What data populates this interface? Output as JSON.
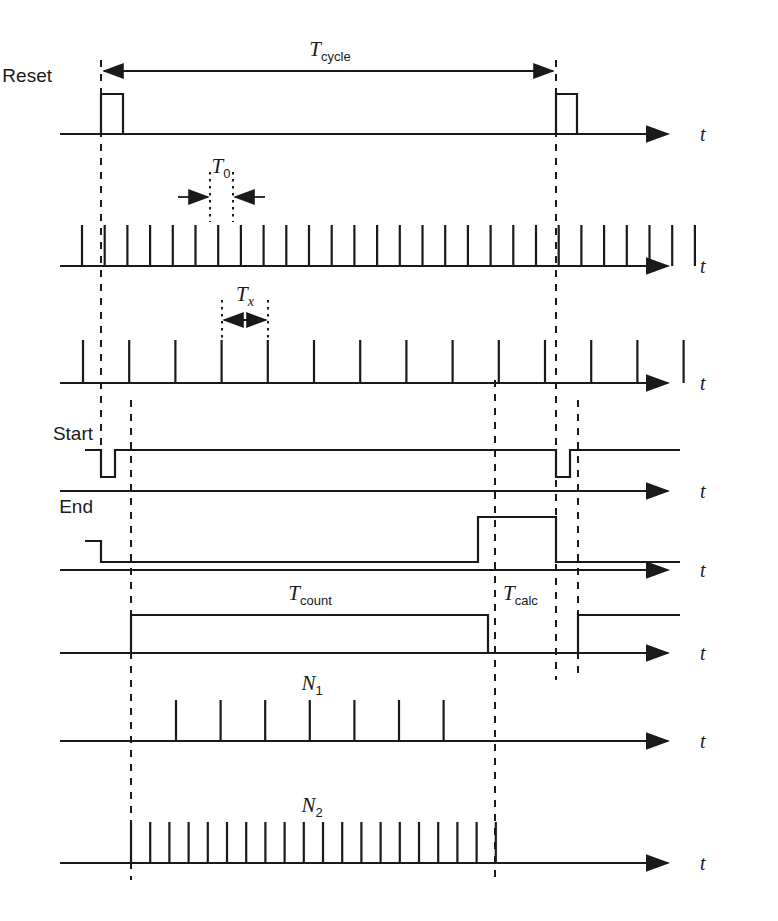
{
  "figure": {
    "type": "timing-diagram",
    "title": "",
    "background": "#ffffff",
    "ink": "#1a1a1a",
    "axis_symbol": "t"
  },
  "labels": {
    "reset": "Reset",
    "start": "Start",
    "end": "End",
    "t_axis": "t"
  },
  "annotations": {
    "t_cycle": {
      "base": "T",
      "sub": "cycle"
    },
    "t_zero": {
      "base": "T",
      "sub": "0"
    },
    "t_x": {
      "base": "T",
      "sub": "x"
    },
    "t_count": {
      "base": "T",
      "sub": "count"
    },
    "t_calc": {
      "base": "T",
      "sub": "calc"
    },
    "n_one": {
      "base": "N",
      "sub": "1"
    },
    "n_two": {
      "base": "N",
      "sub": "2"
    }
  },
  "chart_data": {
    "type": "timing-waveform",
    "xlabel": "t",
    "ylabel": "",
    "time_markers": {
      "cycle_start": 101,
      "count_start": 131,
      "count_end": 488,
      "calc_mark": 495,
      "cycle_end": 556,
      "calc_end": 578
    },
    "traces": [
      {
        "name": "Reset",
        "kind": "pulse-high",
        "label": "Reset",
        "baseline_y": 134,
        "high_y": 94,
        "pulses": [
          {
            "start": 101,
            "end": 123
          },
          {
            "start": 556,
            "end": 577
          }
        ],
        "axis_x0": 60,
        "axis_x1": 680,
        "annotation": "T_cycle spanning 101 to 556"
      },
      {
        "name": "T0 clock",
        "kind": "impulse-train",
        "label": "",
        "baseline_y": 266,
        "pulse_top_y": 225,
        "count": 28,
        "first_x": 82,
        "spacing": 22.7,
        "axis_x0": 60,
        "axis_x1": 680,
        "period_marker": {
          "symbol": "T0",
          "from": 210,
          "to": 233
        }
      },
      {
        "name": "Tx clock",
        "kind": "impulse-train",
        "label": "",
        "baseline_y": 383,
        "pulse_top_y": 340,
        "count": 14,
        "first_x": 83,
        "spacing": 46.2,
        "axis_x0": 60,
        "axis_x1": 680,
        "period_marker": {
          "symbol": "Tx",
          "from": 222,
          "to": 268
        }
      },
      {
        "name": "Start",
        "kind": "level-low-notch",
        "label": "Start",
        "baseline_y": 491,
        "high_y": 450,
        "low_y": 477,
        "line_x0": 85,
        "line_x1": 680,
        "notches": [
          {
            "start": 101,
            "end": 115
          },
          {
            "start": 556,
            "end": 570
          }
        ],
        "axis_x0": 60,
        "axis_x1": 680
      },
      {
        "name": "End",
        "kind": "level-high-pulse",
        "label": "End",
        "baseline_y": 570,
        "idle_y": 541,
        "high_y": 517,
        "line_x0": 85,
        "line_x1": 680,
        "low_from": 101,
        "pulses": [
          {
            "start": 478,
            "end": 556
          }
        ],
        "axis_x0": 60,
        "axis_x1": 680
      },
      {
        "name": "Count / Calc",
        "kind": "level-high-pulse",
        "label": "",
        "baseline_y": 653,
        "high_y": 615,
        "line_x0": 60,
        "line_x1": 680,
        "pulses": [
          {
            "start": 131,
            "end": 488
          },
          {
            "start": 578,
            "end": 680
          }
        ],
        "axis_x0": 60,
        "axis_x1": 680,
        "annotations": [
          {
            "symbol": "T_count",
            "x": 310,
            "y": 600
          },
          {
            "symbol": "T_calc",
            "x": 500,
            "y": 600
          }
        ]
      },
      {
        "name": "N1",
        "kind": "impulse-train",
        "label": "N1",
        "baseline_y": 741,
        "pulse_top_y": 700,
        "count": 7,
        "first_x": 176,
        "spacing": 44.6,
        "axis_x0": 60,
        "axis_x1": 680
      },
      {
        "name": "N2",
        "kind": "impulse-train",
        "label": "N2",
        "baseline_y": 863,
        "pulse_top_y": 822,
        "count": 20,
        "first_x": 131,
        "spacing": 19.2,
        "axis_x0": 60,
        "axis_x1": 680
      }
    ],
    "guides": [
      {
        "x": 101,
        "y0": 60,
        "y1": 470
      },
      {
        "x": 131,
        "y0": 400,
        "y1": 880
      },
      {
        "x": 495,
        "y0": 380,
        "y1": 880
      },
      {
        "x": 556,
        "y0": 60,
        "y1": 680
      },
      {
        "x": 578,
        "y0": 400,
        "y1": 680
      }
    ]
  }
}
